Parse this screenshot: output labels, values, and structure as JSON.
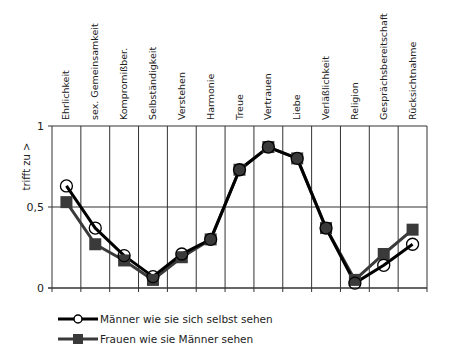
{
  "chart_data": {
    "type": "line",
    "title": "",
    "xlabel": "",
    "ylabel": "trifft zu >",
    "ylim": [
      0,
      1
    ],
    "yticks": [
      {
        "value": 0,
        "label": "0"
      },
      {
        "value": 0.5,
        "label": "0,5"
      },
      {
        "value": 1,
        "label": "1"
      }
    ],
    "grid": true,
    "legend_position": "bottom-left",
    "categories": [
      "Ehrlichkeit",
      "sex. Gemeinsamkeit",
      "Kompromißber.",
      "Selbständigkeit",
      "Verstehen",
      "Harmonie",
      "Treue",
      "Vertrauen",
      "Liebe",
      "Verläßlichkeit",
      "Religion",
      "Gesprächsbereitschaft",
      "Rücksichtnahme"
    ],
    "series": [
      {
        "name": "Männer wie sie sich selbst sehen",
        "marker": "open-circle",
        "color": "#000000",
        "values": [
          0.63,
          0.37,
          0.2,
          0.07,
          0.21,
          0.3,
          0.73,
          0.87,
          0.8,
          0.37,
          0.03,
          0.14,
          0.27
        ]
      },
      {
        "name": "Frauen wie sie Männer sehen",
        "marker": "filled-square",
        "color": "#3a3a3a",
        "values": [
          0.53,
          0.27,
          0.17,
          0.05,
          0.19,
          0.3,
          0.73,
          0.87,
          0.8,
          0.37,
          0.05,
          0.21,
          0.36
        ]
      }
    ]
  },
  "legend": {
    "items": [
      {
        "label": "Männer wie sie sich selbst sehen"
      },
      {
        "label": "Frauen wie sie Männer sehen"
      }
    ]
  }
}
